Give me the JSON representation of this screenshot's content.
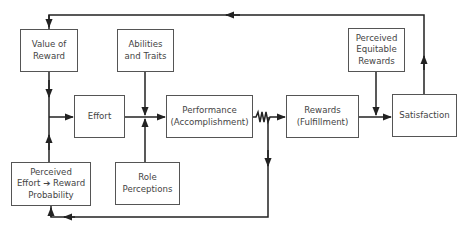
{
  "diagram": {
    "title": "",
    "nodes": [
      {
        "id": "value-of-reward",
        "lines": [
          "Value of",
          "Reward"
        ]
      },
      {
        "id": "abilities-traits",
        "lines": [
          "Abilities",
          "and Traits"
        ]
      },
      {
        "id": "effort",
        "lines": [
          "Effort"
        ]
      },
      {
        "id": "performance",
        "lines": [
          "Performance",
          "(Accomplishment)"
        ]
      },
      {
        "id": "rewards",
        "lines": [
          "Rewards",
          "(Fulfillment)"
        ]
      },
      {
        "id": "perceived-equitable-rewards",
        "lines": [
          "Perceived",
          "Equitable",
          "Rewards"
        ]
      },
      {
        "id": "satisfaction",
        "lines": [
          "Satisfaction"
        ]
      },
      {
        "id": "perceived-effort-reward-probability",
        "lines": [
          "Perceived",
          "Effort ➔ Reward",
          "Probability"
        ]
      },
      {
        "id": "role-perceptions",
        "lines": [
          "Role",
          "Perceptions"
        ]
      }
    ],
    "edges": [
      {
        "from": "value-of-reward",
        "to": "effort"
      },
      {
        "from": "perceived-effort-reward-probability",
        "to": "effort"
      },
      {
        "from": "effort",
        "to": "performance"
      },
      {
        "from": "abilities-traits",
        "to": "performance"
      },
      {
        "from": "role-perceptions",
        "to": "performance"
      },
      {
        "from": "performance",
        "to": "rewards",
        "style": "wavy"
      },
      {
        "from": "performance",
        "to": "perceived-effort-reward-probability",
        "style": "feedback"
      },
      {
        "from": "rewards",
        "to": "satisfaction"
      },
      {
        "from": "perceived-equitable-rewards",
        "to": "satisfaction"
      },
      {
        "from": "satisfaction",
        "to": "value-of-reward",
        "style": "feedback"
      }
    ]
  }
}
